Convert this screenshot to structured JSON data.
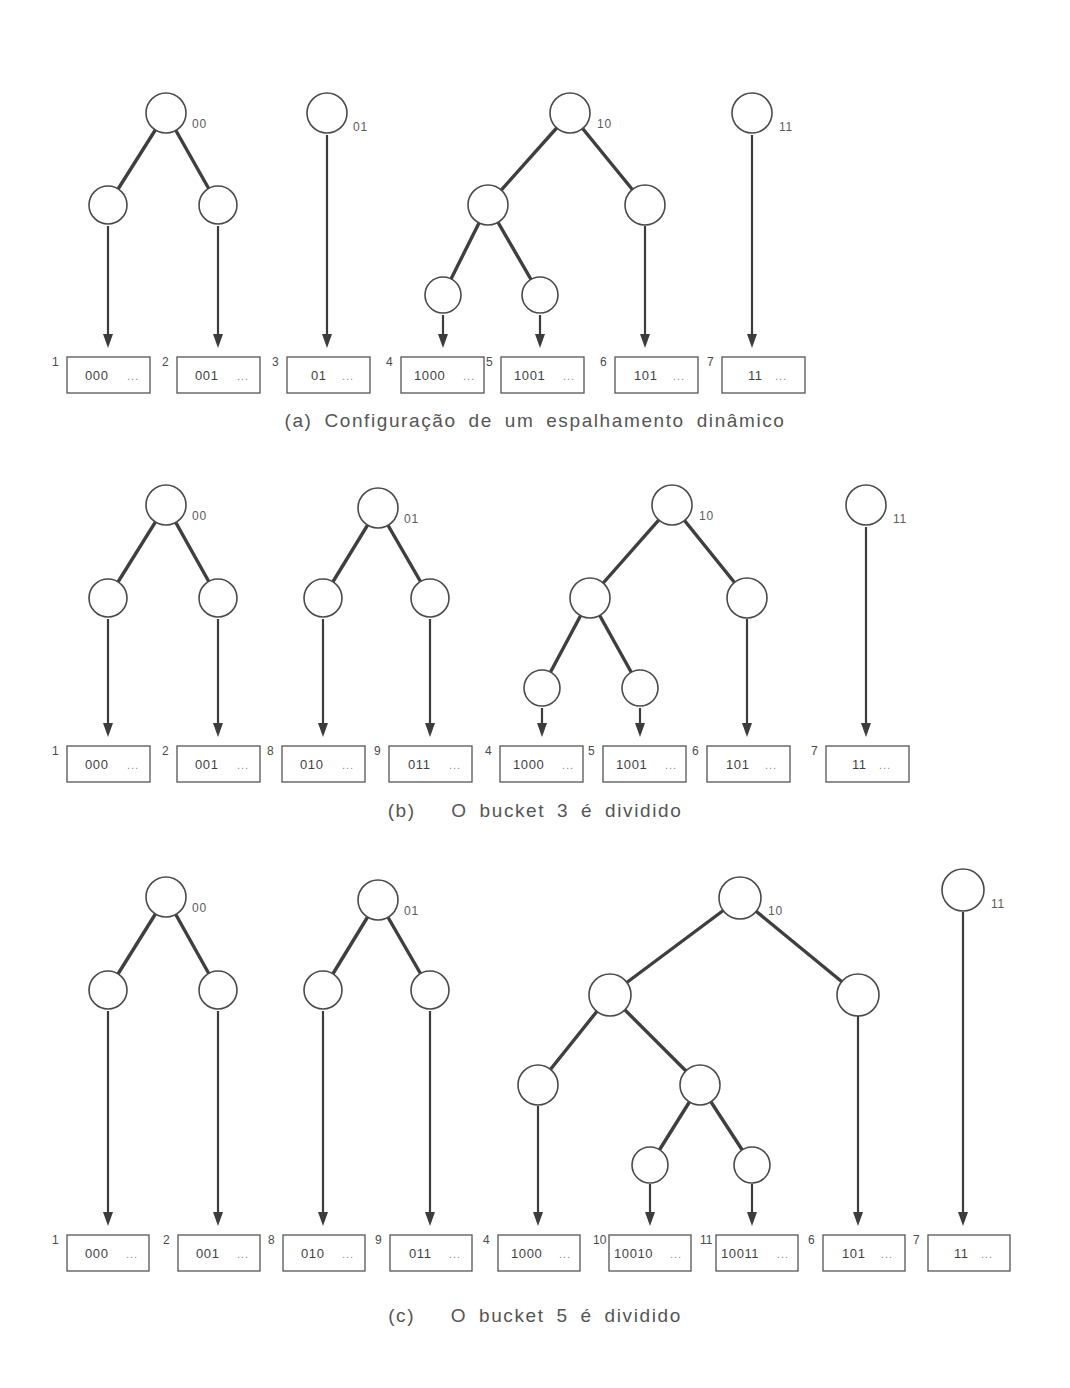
{
  "figure": {
    "background_color": "#ffffff",
    "ink_color": "#3f3f3f",
    "panels": [
      {
        "id": "a",
        "caption": "(a) Configuração de um espalhamento dinâmico",
        "trees": [
          {
            "root_label": "00",
            "leaf_count": 2
          },
          {
            "root_label": "01",
            "leaf_count": 1
          },
          {
            "root_label": "10",
            "leaf_count": 3
          },
          {
            "root_label": "11",
            "leaf_count": 1
          }
        ],
        "buckets": [
          {
            "index": "1",
            "key": "000",
            "ellipsis": "..."
          },
          {
            "index": "2",
            "key": "001",
            "ellipsis": "..."
          },
          {
            "index": "3",
            "key": "01",
            "ellipsis": "..."
          },
          {
            "index": "4",
            "key": "1000",
            "ellipsis": "..."
          },
          {
            "index": "5",
            "key": "1001",
            "ellipsis": "..."
          },
          {
            "index": "6",
            "key": "101",
            "ellipsis": "..."
          },
          {
            "index": "7",
            "key": "11",
            "ellipsis": "..."
          }
        ]
      },
      {
        "id": "b",
        "caption": "(b)   O bucket 3 é dividido",
        "trees": [
          {
            "root_label": "00",
            "leaf_count": 2
          },
          {
            "root_label": "01",
            "leaf_count": 2
          },
          {
            "root_label": "10",
            "leaf_count": 3
          },
          {
            "root_label": "11",
            "leaf_count": 1
          }
        ],
        "buckets": [
          {
            "index": "1",
            "key": "000",
            "ellipsis": "..."
          },
          {
            "index": "2",
            "key": "001",
            "ellipsis": "..."
          },
          {
            "index": "8",
            "key": "010",
            "ellipsis": "..."
          },
          {
            "index": "9",
            "key": "011",
            "ellipsis": "..."
          },
          {
            "index": "4",
            "key": "1000",
            "ellipsis": "..."
          },
          {
            "index": "5",
            "key": "1001",
            "ellipsis": "..."
          },
          {
            "index": "6",
            "key": "101",
            "ellipsis": "..."
          },
          {
            "index": "7",
            "key": "11",
            "ellipsis": "..."
          }
        ]
      },
      {
        "id": "c",
        "caption": "(c)   O bucket 5 é dividido",
        "trees": [
          {
            "root_label": "00",
            "leaf_count": 2
          },
          {
            "root_label": "01",
            "leaf_count": 2
          },
          {
            "root_label": "10",
            "leaf_count": 4
          },
          {
            "root_label": "11",
            "leaf_count": 1
          }
        ],
        "buckets": [
          {
            "index": "1",
            "key": "000",
            "ellipsis": "..."
          },
          {
            "index": "2",
            "key": "001",
            "ellipsis": "..."
          },
          {
            "index": "8",
            "key": "010",
            "ellipsis": "..."
          },
          {
            "index": "9",
            "key": "011",
            "ellipsis": "..."
          },
          {
            "index": "4",
            "key": "1000",
            "ellipsis": "..."
          },
          {
            "index": "10",
            "key": "10010",
            "ellipsis": "..."
          },
          {
            "index": "11",
            "key": "10011",
            "ellipsis": "..."
          },
          {
            "index": "6",
            "key": "101",
            "ellipsis": "..."
          },
          {
            "index": "7",
            "key": "11",
            "ellipsis": "..."
          }
        ]
      }
    ]
  }
}
